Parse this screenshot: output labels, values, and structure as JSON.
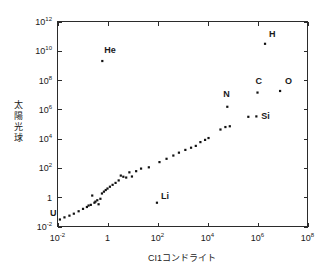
{
  "chart_data": {
    "type": "scatter",
    "title": "",
    "xlabel": "CI1コンドライト",
    "ylabel": "太陽光球",
    "xscale": "log",
    "yscale": "log",
    "xlim": [
      0.01,
      100000000
    ],
    "ylim": [
      0.01,
      1000000000000
    ],
    "grid": false,
    "legend": null,
    "x_ticks": [
      {
        "value": 0.01,
        "mantissa": "10",
        "exponent": "-2"
      },
      {
        "value": 1,
        "mantissa": "1",
        "exponent": ""
      },
      {
        "value": 100,
        "mantissa": "10",
        "exponent": "2"
      },
      {
        "value": 10000,
        "mantissa": "10",
        "exponent": "4"
      },
      {
        "value": 1000000,
        "mantissa": "10",
        "exponent": "6"
      },
      {
        "value": 100000000,
        "mantissa": "10",
        "exponent": "8"
      }
    ],
    "y_ticks": [
      {
        "value": 1000000000000,
        "mantissa": "10",
        "exponent": "12"
      },
      {
        "value": 10000000000,
        "mantissa": "10",
        "exponent": "10"
      },
      {
        "value": 100000000,
        "mantissa": "10",
        "exponent": "8"
      },
      {
        "value": 1000000,
        "mantissa": "10",
        "exponent": "6"
      },
      {
        "value": 10000,
        "mantissa": "10",
        "exponent": "4"
      },
      {
        "value": 100,
        "mantissa": "10",
        "exponent": "2"
      },
      {
        "value": 1,
        "mantissa": "1",
        "exponent": ""
      },
      {
        "value": 0.01,
        "mantissa": "10",
        "exponent": "-2"
      }
    ],
    "points": [
      {
        "x": 0.0125,
        "y": 0.03,
        "label": "U",
        "label_dx": -10,
        "label_dy": -4
      },
      {
        "x": 0.019,
        "y": 0.042,
        "label": ""
      },
      {
        "x": 0.03,
        "y": 0.055,
        "label": ""
      },
      {
        "x": 0.045,
        "y": 0.075,
        "label": ""
      },
      {
        "x": 0.07,
        "y": 0.11,
        "label": ""
      },
      {
        "x": 0.105,
        "y": 0.16,
        "label": ""
      },
      {
        "x": 0.15,
        "y": 0.215,
        "label": ""
      },
      {
        "x": 0.175,
        "y": 0.27,
        "label": ""
      },
      {
        "x": 0.215,
        "y": 0.3,
        "label": ""
      },
      {
        "x": 0.245,
        "y": 1.3,
        "label": ""
      },
      {
        "x": 0.3,
        "y": 0.42,
        "label": ""
      },
      {
        "x": 0.33,
        "y": 0.5,
        "label": ""
      },
      {
        "x": 0.39,
        "y": 0.62,
        "label": ""
      },
      {
        "x": 0.44,
        "y": 0.33,
        "label": ""
      },
      {
        "x": 0.52,
        "y": 0.78,
        "label": ""
      },
      {
        "x": 0.6,
        "y": 1.8,
        "label": ""
      },
      {
        "x": 0.62,
        "y": 2000000000.0,
        "label": "He",
        "label_dx": 2,
        "label_dy": -8
      },
      {
        "x": 0.72,
        "y": 2.4,
        "label": ""
      },
      {
        "x": 0.85,
        "y": 3.1,
        "label": ""
      },
      {
        "x": 1.0,
        "y": 3.9,
        "label": ""
      },
      {
        "x": 1.25,
        "y": 5.2,
        "label": ""
      },
      {
        "x": 1.6,
        "y": 7.0,
        "label": ""
      },
      {
        "x": 2.1,
        "y": 9.5,
        "label": ""
      },
      {
        "x": 2.8,
        "y": 14.0,
        "label": ""
      },
      {
        "x": 3.4,
        "y": 30.0,
        "label": ""
      },
      {
        "x": 4.3,
        "y": 25.0,
        "label": ""
      },
      {
        "x": 5.6,
        "y": 22.0,
        "label": ""
      },
      {
        "x": 7.5,
        "y": 50.0,
        "label": ""
      },
      {
        "x": 9.5,
        "y": 26.0,
        "label": ""
      },
      {
        "x": 14.0,
        "y": 60.0,
        "label": ""
      },
      {
        "x": 22.0,
        "y": 90.0,
        "label": ""
      },
      {
        "x": 45.0,
        "y": 110.0,
        "label": ""
      },
      {
        "x": 95.0,
        "y": 0.42,
        "label": "Li",
        "label_dx": 4,
        "label_dy": -4
      },
      {
        "x": 120.0,
        "y": 250.0,
        "label": ""
      },
      {
        "x": 230.0,
        "y": 420.0,
        "label": ""
      },
      {
        "x": 430.0,
        "y": 700.0,
        "label": ""
      },
      {
        "x": 720.0,
        "y": 1100.0,
        "label": ""
      },
      {
        "x": 1300.0,
        "y": 1700.0,
        "label": ""
      },
      {
        "x": 2200.0,
        "y": 2400.0,
        "label": ""
      },
      {
        "x": 3400.0,
        "y": 3200.0,
        "label": ""
      },
      {
        "x": 5200.0,
        "y": 5800.0,
        "label": ""
      },
      {
        "x": 8000.0,
        "y": 8200.0,
        "label": ""
      },
      {
        "x": 11000.0,
        "y": 11000.0,
        "label": ""
      },
      {
        "x": 33000.0,
        "y": 42000.0,
        "label": ""
      },
      {
        "x": 52000.0,
        "y": 62000.0,
        "label": ""
      },
      {
        "x": 78000.0,
        "y": 70000.0,
        "label": ""
      },
      {
        "x": 62000.0,
        "y": 1500000.0,
        "label": "N",
        "label_dx": -4,
        "label_dy": -10
      },
      {
        "x": 430000.0,
        "y": 310000.0,
        "label": ""
      },
      {
        "x": 900000.0,
        "y": 330000.0,
        "label": "Si",
        "label_dx": 5,
        "label_dy": 3
      },
      {
        "x": 1000000.0,
        "y": 14000000.0,
        "label": "C",
        "label_dx": -2,
        "label_dy": -9
      },
      {
        "x": 2000000.0,
        "y": 30000000000.0,
        "label": "H",
        "label_dx": 4,
        "label_dy": -7
      },
      {
        "x": 8000000.0,
        "y": 18000000.0,
        "label": "O",
        "label_dx": 5,
        "label_dy": -7
      }
    ]
  },
  "style": {
    "axis_color": "#2b2b2b",
    "point_color": "#111111",
    "background": "#ffffff"
  }
}
